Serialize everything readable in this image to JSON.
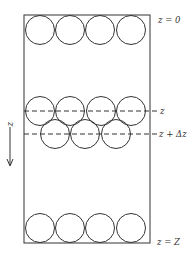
{
  "diagram": {
    "title": "",
    "colors": {
      "stroke": "#333333",
      "background": "#ffffff"
    },
    "column": {
      "x": 24,
      "y": 15,
      "width": 126,
      "height": 228
    },
    "axis": {
      "label": "z",
      "direction": "down",
      "icon": "arrow-down-icon"
    },
    "labels": {
      "top": "z = 0",
      "slice_top": "z",
      "slice_bottom": "z + Δz",
      "bottom": "z = Z"
    },
    "particle_radius": 14.5,
    "rows": [
      {
        "name": "top-row",
        "cy": 30,
        "cx": [
          40,
          70,
          100,
          131
        ]
      },
      {
        "name": "slice-upper-row",
        "cy": 111,
        "cx": [
          40,
          70,
          101,
          131
        ]
      },
      {
        "name": "slice-lower-row",
        "cy": 134,
        "cx": [
          55,
          85,
          116
        ]
      },
      {
        "name": "bottom-row",
        "cy": 228,
        "cx": [
          40,
          70,
          100,
          131
        ]
      }
    ],
    "dashed_lines": [
      {
        "name": "slice-top-line",
        "y": 111
      },
      {
        "name": "slice-bottom-line",
        "y": 134
      }
    ]
  }
}
